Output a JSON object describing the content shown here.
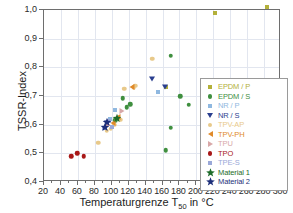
{
  "chart_data": {
    "type": "scatter",
    "title": "",
    "xlabel": "Temperaturgrenze T50 in °C",
    "ylabel": "TSSR-Index",
    "xlim": [
      20,
      300
    ],
    "ylim": [
      0.4,
      1.0
    ],
    "xticks": [
      20,
      40,
      60,
      80,
      100,
      120,
      140,
      160,
      180,
      200,
      220,
      240,
      260,
      280,
      300
    ],
    "xtick_labels": [
      "20",
      "40",
      "60",
      "80",
      "100",
      "120",
      "140",
      "160",
      "180",
      "200",
      "220",
      "240",
      "260",
      "280",
      "300"
    ],
    "yticks": [
      0.4,
      0.5,
      0.6,
      0.7,
      0.8,
      0.9,
      1.0
    ],
    "ytick_labels": [
      "0,4",
      "0,5",
      "0,6",
      "0,7",
      "0,8",
      "0,9",
      "1,0"
    ],
    "grid": true,
    "legend_position": "lower-right-inside",
    "series": [
      {
        "name": "EPDM / P",
        "color": "#b3b03a",
        "marker": "square",
        "points": [
          [
            222,
            0.99
          ],
          [
            283,
            1.01
          ],
          [
            164,
            0.73
          ]
        ]
      },
      {
        "name": "EPDM / S",
        "color": "#3f8f3f",
        "marker": "circle",
        "points": [
          [
            107,
            0.625
          ],
          [
            122,
            0.672
          ],
          [
            118,
            0.66
          ],
          [
            113,
            0.692
          ],
          [
            170,
            0.84
          ],
          [
            181,
            0.7
          ],
          [
            191,
            0.67
          ],
          [
            208,
            0.73
          ],
          [
            170,
            0.59
          ],
          [
            164,
            0.51
          ],
          [
            104,
            0.615
          ]
        ]
      },
      {
        "name": "NR / P",
        "color": "#8fb8e0",
        "marker": "square",
        "points": [
          [
            104,
            0.65
          ],
          [
            155,
            0.715
          ],
          [
            98,
            0.62
          ]
        ]
      },
      {
        "name": "NR / S",
        "color": "#2a3f8f",
        "marker": "triangle-down",
        "points": [
          [
            148,
            0.76
          ],
          [
            163,
            0.73
          ],
          [
            94,
            0.605
          ]
        ]
      },
      {
        "name": "TPV-AP",
        "color": "#e8c98a",
        "marker": "circle",
        "points": [
          [
            84,
            0.537
          ],
          [
            99,
            0.585
          ],
          [
            103,
            0.6
          ],
          [
            110,
            0.618
          ],
          [
            115,
            0.725
          ],
          [
            126,
            0.73
          ],
          [
            128,
            0.735
          ],
          [
            148,
            0.83
          ],
          [
            94,
            0.578
          ]
        ]
      },
      {
        "name": "TPV-PH",
        "color": "#e08a2a",
        "marker": "triangle-left",
        "points": [
          [
            101,
            0.605
          ],
          [
            108,
            0.628
          ],
          [
            124,
            0.732
          ]
        ]
      },
      {
        "name": "TPU",
        "color": "#d8a8a8",
        "marker": "triangle-right",
        "points": [
          [
            96,
            0.6
          ],
          [
            112,
            0.646
          ]
        ]
      },
      {
        "name": "TPO",
        "color": "#a81818",
        "marker": "circle",
        "points": [
          [
            52,
            0.49
          ],
          [
            59,
            0.5
          ],
          [
            67,
            0.49
          ]
        ]
      },
      {
        "name": "TPE-S",
        "color": "#9aa8d8",
        "marker": "square",
        "points": [
          [
            91,
            0.59
          ],
          [
            97,
            0.612
          ],
          [
            100,
            0.593
          ]
        ]
      },
      {
        "name": "Material 1",
        "color": "#1d6b2a",
        "marker": "star",
        "points": [
          [
            106,
            0.622
          ]
        ]
      },
      {
        "name": "Material 2",
        "color": "#1d2f7a",
        "marker": "star",
        "points": [
          [
            92,
            0.592
          ],
          [
            95,
            0.608
          ]
        ]
      }
    ]
  },
  "axis": {
    "x_title_main": "Temperaturgrenze T",
    "x_title_sub": "50",
    "x_title_tail": " in °C",
    "y_title": "TSSR-Index"
  }
}
